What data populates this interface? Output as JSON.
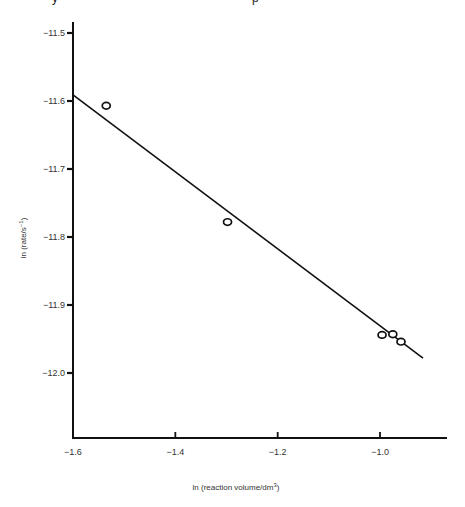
{
  "chart_data": {
    "type": "scatter",
    "title": "",
    "xlabel": "ln (reaction volume/dm",
    "xlabel_sup": "3",
    "xlabel_tail": ")",
    "ylabel": "ln (rate/s",
    "ylabel_sup": "−1",
    "ylabel_tail": ")",
    "xlim": [
      -1.6,
      -0.87
    ],
    "ylim": [
      -12.1,
      -11.48
    ],
    "x_ticks": [
      -1.6,
      -1.4,
      -1.2,
      -1.0
    ],
    "x_tick_labels": [
      "−1.6",
      "−1.4",
      "−1.2",
      "−1.0"
    ],
    "y_ticks": [
      -11.5,
      -11.6,
      -11.7,
      -11.8,
      -11.9,
      -12.0
    ],
    "y_tick_labels": [
      "−11.5",
      "−11.6",
      "−11.7",
      "−11.8",
      "−11.9",
      "−12.0"
    ],
    "grid": false,
    "legend": null,
    "series": [
      {
        "name": "measured",
        "marker": "open-circle",
        "points": [
          {
            "x": -1.535,
            "y": -11.607
          },
          {
            "x": -1.298,
            "y": -11.778
          },
          {
            "x": -0.996,
            "y": -11.944
          },
          {
            "x": -0.975,
            "y": -11.943
          },
          {
            "x": -0.959,
            "y": -11.954
          }
        ]
      },
      {
        "name": "fit-line",
        "style": "line",
        "points": [
          {
            "x": -1.6,
            "y": -11.591
          },
          {
            "x": -0.916,
            "y": -11.978
          }
        ]
      }
    ]
  },
  "page": {
    "cropped_top_fragments": [
      "y",
      "p"
    ]
  }
}
